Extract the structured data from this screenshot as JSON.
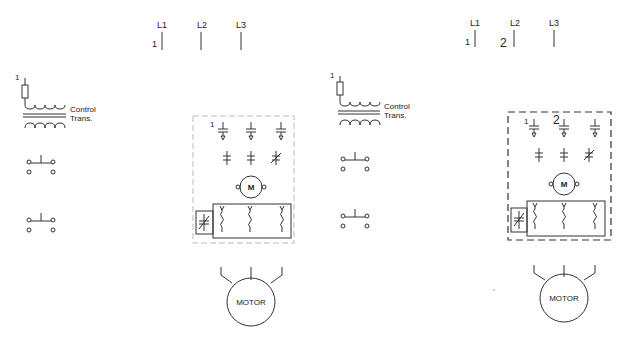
{
  "panels": [
    {
      "id": "left",
      "lines": [
        "L1",
        "L2",
        "L3"
      ],
      "line_markers": [
        "1"
      ],
      "transformer": {
        "marker": "1",
        "label_line1": "Control",
        "label_line2": "Trans."
      },
      "starter_markers": [
        "1"
      ],
      "motor_symbol": "M",
      "motor_label": "MOTOR",
      "enclosure_style": "light-dashed"
    },
    {
      "id": "right",
      "lines": [
        "L1",
        "L2",
        "L3"
      ],
      "line_markers": [
        "1",
        "2"
      ],
      "transformer": {
        "marker": "1",
        "label_line1": "Control",
        "label_line2": "Trans."
      },
      "starter_markers": [
        "1",
        "2"
      ],
      "motor_symbol": "M",
      "motor_label": "MOTOR",
      "enclosure_style": "dark-dashed"
    }
  ]
}
